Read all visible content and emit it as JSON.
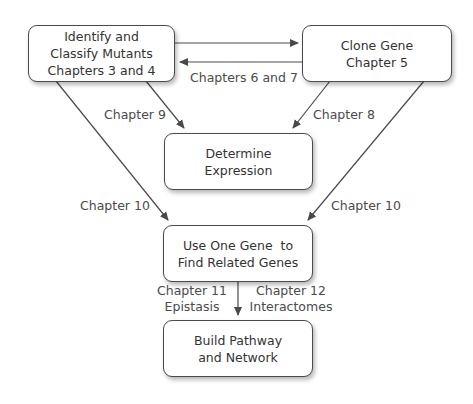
{
  "diagram": {
    "nodes": [
      {
        "id": "identify",
        "lines": [
          "Identify and",
          "Classify Mutants",
          "Chapters 3 and 4"
        ]
      },
      {
        "id": "clone",
        "lines": [
          "Clone Gene",
          "Chapter 5"
        ]
      },
      {
        "id": "expression",
        "lines": [
          "Determine",
          "Expression"
        ]
      },
      {
        "id": "related",
        "lines": [
          "Use One Gene  to",
          "Find Related Genes"
        ]
      },
      {
        "id": "pathway",
        "lines": [
          "Build Pathway",
          "and Network"
        ]
      }
    ],
    "edges": [
      {
        "from": "identify",
        "to": "clone",
        "label": ""
      },
      {
        "from": "clone",
        "to": "identify",
        "label": "Chapters 6 and 7"
      },
      {
        "from": "identify",
        "to": "expression",
        "label": "Chapter 9"
      },
      {
        "from": "clone",
        "to": "expression",
        "label": "Chapter 8"
      },
      {
        "from": "identify",
        "to": "related",
        "label": "Chapter 10"
      },
      {
        "from": "clone",
        "to": "related",
        "label": "Chapter 10"
      },
      {
        "from": "related",
        "to": "pathway",
        "label_left": [
          "Chapter 11",
          "Epistasis"
        ],
        "label_right": [
          "Chapter 12",
          "Interactomes"
        ]
      }
    ],
    "colors": {
      "line": "#4a4a4a",
      "text": "#333333",
      "label": "#4a4a4a"
    }
  }
}
